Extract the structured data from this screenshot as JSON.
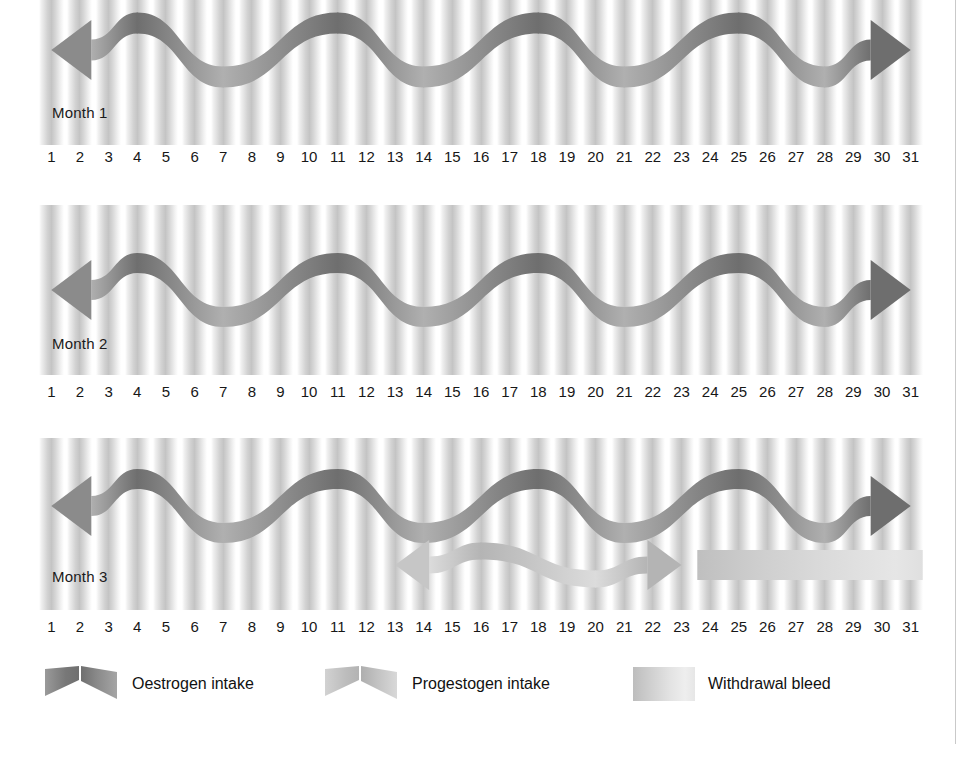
{
  "figure": {
    "day_count": 31,
    "days": [
      1,
      2,
      3,
      4,
      5,
      6,
      7,
      8,
      9,
      10,
      11,
      12,
      13,
      14,
      15,
      16,
      17,
      18,
      19,
      20,
      21,
      22,
      23,
      24,
      25,
      26,
      27,
      28,
      29,
      30,
      31
    ]
  },
  "colors": {
    "oestrogen_dark": "#7c7c7c",
    "oestrogen_light": "#a8a8a8",
    "progestogen_dark": "#bcbcbc",
    "progestogen_light": "#d8d8d8",
    "withdrawal_bleed": "#cfcfcf",
    "stripe": "#c4c4c4",
    "text": "#111111",
    "rule": "#c9c9c9"
  },
  "months": [
    {
      "label": "Month 1",
      "oestrogen": {
        "name": "Oestrogen intake",
        "start_day": 1,
        "end_day": 31,
        "arrow_left": true,
        "arrow_right": true,
        "wave_peaks_days": [
          4,
          11,
          18,
          25
        ],
        "wave_troughs_days": [
          7,
          14,
          21,
          28
        ]
      },
      "progestogen": null,
      "withdrawal_bleed": null
    },
    {
      "label": "Month 2",
      "oestrogen": {
        "name": "Oestrogen intake",
        "start_day": 1,
        "end_day": 31,
        "arrow_left": true,
        "arrow_right": true,
        "wave_peaks_days": [
          4,
          11,
          18,
          25
        ],
        "wave_troughs_days": [
          7,
          14,
          21,
          28
        ]
      },
      "progestogen": null,
      "withdrawal_bleed": null
    },
    {
      "label": "Month 3",
      "oestrogen": {
        "name": "Oestrogen intake",
        "start_day": 1,
        "end_day": 31,
        "arrow_left": true,
        "arrow_right": true,
        "wave_peaks_days": [
          4,
          11,
          18,
          25
        ],
        "wave_troughs_days": [
          7,
          14,
          21,
          28
        ]
      },
      "progestogen": {
        "name": "Progestogen intake",
        "start_day": 13,
        "end_day": 23,
        "arrow_left": true,
        "arrow_right": true,
        "wave_peaks_days": [
          16
        ],
        "wave_troughs_days": [
          20
        ]
      },
      "withdrawal_bleed": {
        "name": "Withdrawal bleed",
        "start_day": 24,
        "end_day": 31
      }
    }
  ],
  "legend": {
    "items": [
      {
        "key": "oestrogen",
        "label": "Oestrogen intake",
        "swatch": "ribbon-dark"
      },
      {
        "key": "progestogen",
        "label": "Progestogen intake",
        "swatch": "ribbon-light"
      },
      {
        "key": "bleed",
        "label": "Withdrawal bleed",
        "swatch": "gradient-bar"
      }
    ]
  }
}
